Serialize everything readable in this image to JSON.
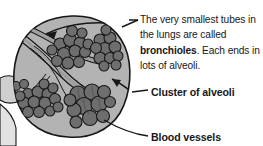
{
  "figure": {
    "background_color": "#ffffff",
    "ink_color": "#17171a",
    "blob_fill": "#b3b3b3",
    "cluster_fill": "#6e6e6e",
    "tube_fill": "#8f8f8f"
  },
  "callouts": {
    "bronchioles": {
      "text_part1": "The very smallest tubes in the lungs are called ",
      "bold_term": "bronchioles",
      "text_part2": ". Each ends in lots of alveoli."
    },
    "cluster_label": "Cluster of alveoli",
    "blood_label": "Blood vessels"
  },
  "icons": {
    "arrow_bronchiole": "arrow-pointing-to-bronchiole",
    "arrow_cluster": "arrow-pointing-to-alveoli-cluster",
    "leader_blood": "leader-line-to-blood-vessels"
  }
}
